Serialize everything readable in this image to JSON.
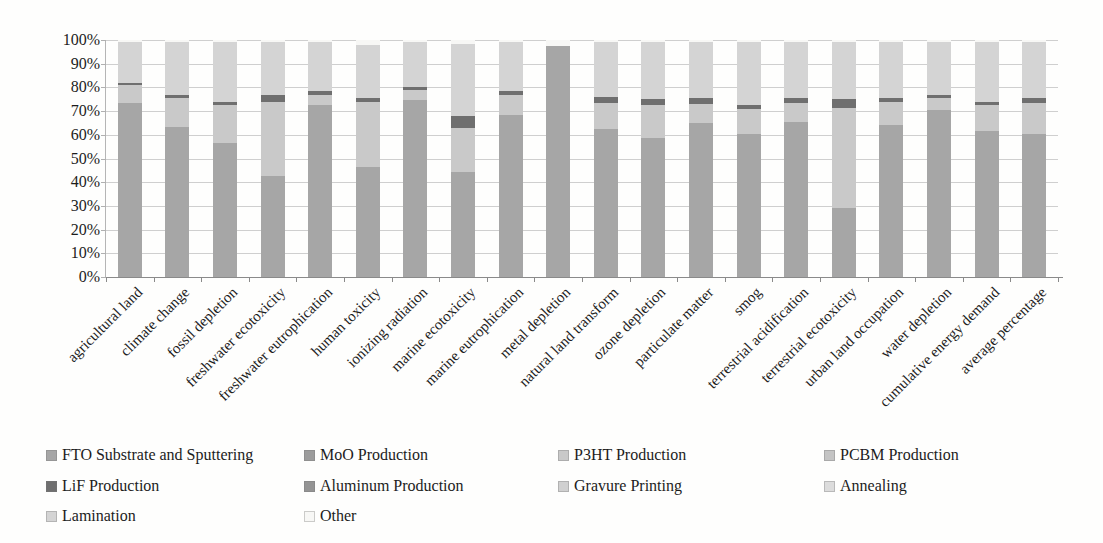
{
  "chart_data": {
    "type": "bar",
    "stacked": true,
    "stacked_mode": "percent",
    "title": "",
    "xlabel": "",
    "ylabel": "",
    "ylim": [
      0,
      100
    ],
    "grid": true,
    "legend_position": "bottom",
    "y_ticks": [
      "100%",
      "90%",
      "80%",
      "70%",
      "60%",
      "50%",
      "40%",
      "30%",
      "20%",
      "10%",
      "0%"
    ],
    "categories": [
      "agricultural land",
      "climate change",
      "fossil depletion",
      "freshwater ecotoxicity",
      "freshwater eutrophication",
      "human toxicity",
      "ionizing radiation",
      "marine ecotoxicity",
      "marine eutrophication",
      "metal depletion",
      "natural land transform",
      "ozone depletion",
      "particulate matter",
      "smog",
      "terrestrial acidification",
      "terrestrial ecotoxicity",
      "urban land occupation",
      "water depletion",
      "cumulative energy demand",
      "average percentage"
    ],
    "series": [
      {
        "name": "FTO Substrate and Sputtering",
        "color": "#a6a6a6",
        "values": [
          73.5,
          63.5,
          56.5,
          42.5,
          72.5,
          46.5,
          74.5,
          44.5,
          68.5,
          97.5,
          62.5,
          58.5,
          65,
          60.5,
          65.5,
          29,
          64,
          70.5,
          61.5,
          60.5
        ]
      },
      {
        "name": "MoO Production",
        "color": "#9c9c9c",
        "values": [
          0,
          0,
          0,
          0,
          0,
          0,
          0,
          0,
          0,
          0,
          0,
          0,
          0,
          0,
          0,
          0,
          0,
          0,
          0,
          0
        ]
      },
      {
        "name": "P3HT Production",
        "color": "#c9c9c9",
        "values": [
          7.5,
          12,
          16,
          31.5,
          4.5,
          27.5,
          4.5,
          18.5,
          8.5,
          0,
          11,
          14,
          8,
          10.5,
          8,
          42.5,
          10,
          5,
          11,
          13
        ]
      },
      {
        "name": "PCBM Production",
        "color": "#c4c4c4",
        "values": [
          0,
          0,
          0,
          0,
          0,
          0,
          0,
          0,
          0,
          0,
          0,
          0,
          0,
          0,
          0,
          0,
          0,
          0,
          0,
          0
        ]
      },
      {
        "name": "LiF Production",
        "color": "#6f6f6f",
        "values": [
          1,
          1.5,
          1.5,
          3,
          1.5,
          1.5,
          1,
          5,
          1.5,
          0,
          2.5,
          2.5,
          2.5,
          1.5,
          2,
          3.5,
          1.5,
          1.5,
          1.5,
          2
        ]
      },
      {
        "name": "Aluminum Production",
        "color": "#949494",
        "values": [
          0,
          0,
          0,
          0,
          0,
          0,
          0,
          0,
          0,
          0,
          0,
          0,
          0,
          0,
          0,
          0,
          0,
          0,
          0,
          0
        ]
      },
      {
        "name": "Gravure Printing",
        "color": "#d0d0d0",
        "values": [
          0,
          0,
          0,
          0,
          0,
          0,
          0,
          0,
          0,
          0,
          0,
          0,
          0,
          0,
          0,
          0,
          0,
          0,
          0,
          0
        ]
      },
      {
        "name": "Annealing",
        "color": "#dcdcdc",
        "values": [
          0,
          0,
          0,
          0,
          0,
          0,
          0,
          0,
          0,
          0,
          0,
          0,
          0,
          0,
          0,
          0,
          0,
          0,
          0,
          0
        ]
      },
      {
        "name": "Lamination",
        "color": "#d4d4d4",
        "values": [
          17,
          22,
          25,
          22,
          20.5,
          22.5,
          19,
          30.5,
          20.5,
          0,
          23,
          24,
          23.5,
          26.5,
          23.5,
          24,
          23.5,
          22,
          25,
          23.5
        ]
      },
      {
        "name": "Other",
        "color": "#f7f7f5",
        "values": [
          1,
          1,
          1,
          1,
          1,
          2,
          1,
          1.5,
          1,
          2.5,
          1,
          1,
          1,
          1,
          1,
          1,
          1,
          1,
          1,
          1
        ]
      }
    ]
  },
  "legend": {
    "labels": [
      "FTO Substrate and Sputtering",
      "MoO Production",
      "P3HT Production",
      "PCBM Production",
      "LiF Production",
      "Aluminum Production",
      "Gravure Printing",
      "Annealing",
      "Lamination",
      "Other"
    ]
  }
}
